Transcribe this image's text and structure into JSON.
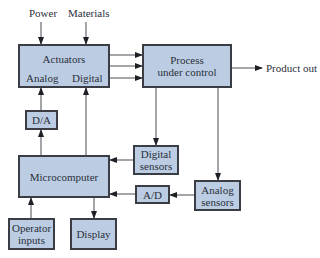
{
  "diagram": {
    "inputs": {
      "power": "Power",
      "materials": "Materials"
    },
    "actuators": {
      "title": "Actuators",
      "analog": "Analog",
      "digital": "Digital"
    },
    "process": {
      "line1": "Process",
      "line2": "under control"
    },
    "output": "Product out",
    "da": "D/A",
    "ad": "A/D",
    "microcomputer": "Microcomputer",
    "digital_sensors": {
      "line1": "Digital",
      "line2": "sensors"
    },
    "analog_sensors": {
      "line1": "Analog",
      "line2": "sensors"
    },
    "operator_inputs": {
      "line1": "Operator",
      "line2": "inputs"
    },
    "display": "Display",
    "colors": {
      "box_fill": "#bccde3",
      "box_border": "#3a3d44",
      "line": "#3a3d44"
    }
  }
}
